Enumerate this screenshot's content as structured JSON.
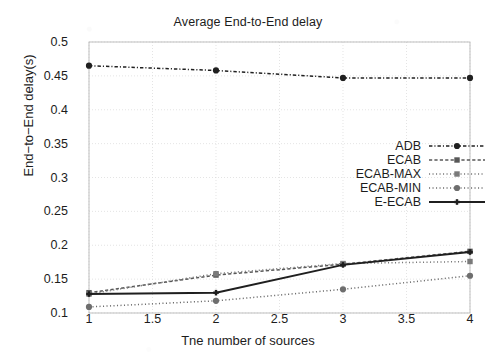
{
  "chart_data": {
    "type": "line",
    "title": "Average End-to-End delay",
    "xlabel": "Tne number of sources",
    "ylabel": "End−to−End delay(s)",
    "x": [
      1,
      2,
      3,
      4
    ],
    "xlim": [
      1,
      4
    ],
    "ylim": [
      0.1,
      0.5
    ],
    "xticks": [
      "1",
      "1.5",
      "2",
      "2.5",
      "3",
      "3.5",
      "4"
    ],
    "xtick_values": [
      1,
      1.5,
      2,
      2.5,
      3,
      3.5,
      4
    ],
    "yticks": [
      "0.5",
      "0.45",
      "0.4",
      "0.35",
      "0.3",
      "0.25",
      "0.2",
      "0.15",
      "0.1"
    ],
    "ytick_values": [
      0.5,
      0.45,
      0.4,
      0.35,
      0.3,
      0.25,
      0.2,
      0.15,
      0.1
    ],
    "grid": true,
    "legend_position": "center-right",
    "series": [
      {
        "name": "ADB",
        "values": [
          0.465,
          0.458,
          0.447,
          0.447
        ],
        "color": "#202020",
        "style": "dash-dot",
        "marker": "circle"
      },
      {
        "name": "ECAB",
        "values": [
          0.13,
          0.156,
          0.172,
          0.191
        ],
        "color": "#585858",
        "style": "dashed",
        "marker": "square"
      },
      {
        "name": "ECAB-MAX",
        "values": [
          0.128,
          0.158,
          0.173,
          0.176
        ],
        "color": "#7a7a7a",
        "style": "dotted",
        "marker": "square"
      },
      {
        "name": "ECAB-MIN",
        "values": [
          0.109,
          0.118,
          0.135,
          0.155
        ],
        "color": "#6e6e6e",
        "style": "dotted",
        "marker": "circle"
      },
      {
        "name": "E-ECAB",
        "values": [
          0.128,
          0.13,
          0.171,
          0.19
        ],
        "color": "#1f1f1f",
        "style": "solid",
        "marker": "plus"
      }
    ]
  }
}
